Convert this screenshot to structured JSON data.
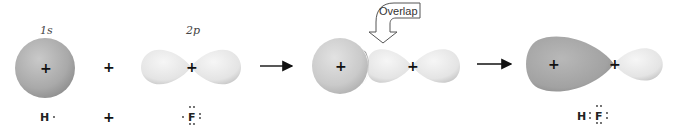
{
  "diagram": {
    "orbital_labels": {
      "h_orbital": "1s",
      "f_orbital": "2p"
    },
    "operators": {
      "plus": "+",
      "plus_nucleus": "+"
    },
    "callout": {
      "label": "Overlap"
    },
    "lewis": {
      "h_atom": "H",
      "h_dot": "·",
      "plus": "+",
      "f_atom": "F",
      "product_h": "H",
      "product_f": "F"
    },
    "colors": {
      "s_orbital": "#a9a9a9",
      "p_orbital": "#e6e6e6",
      "overlap_region": "#8f8f8f",
      "bonding_lobe": "#a3a3a3",
      "arrow": "#111111",
      "callout_stroke": "#555555"
    }
  }
}
